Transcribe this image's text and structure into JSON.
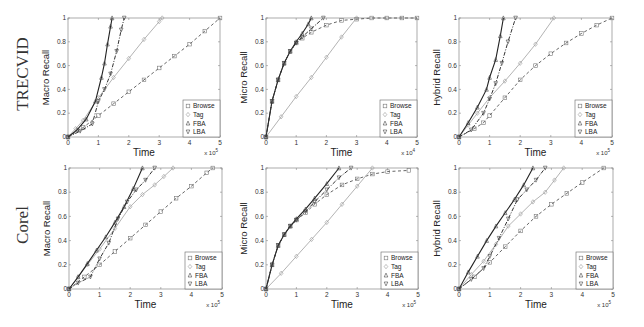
{
  "row_labels": [
    "TRECVID",
    "Corel"
  ],
  "legend": [
    "Browse",
    "Tag",
    "FBA",
    "LBA"
  ],
  "x_multiplier": "x 10^5",
  "chart_data": [
    {
      "type": "line",
      "dataset": "TRECVID",
      "title": "",
      "xlabel": "Time",
      "ylabel": "Macro Recall",
      "xlim": [
        0,
        5
      ],
      "ylim": [
        0,
        1
      ],
      "xticks": [
        0,
        1,
        2,
        3,
        4,
        5
      ],
      "yticks": [
        0,
        0.2,
        0.4,
        0.6,
        0.8,
        1
      ],
      "x_multiplier": "x 10^5",
      "legend_position": "lower right",
      "series": [
        {
          "name": "Browse",
          "x": [
            0,
            0.5,
            1,
            1.5,
            2,
            2.5,
            3,
            3.5,
            4,
            4.5,
            5
          ],
          "y": [
            0,
            0.08,
            0.18,
            0.28,
            0.38,
            0.48,
            0.58,
            0.68,
            0.78,
            0.89,
            1.0
          ]
        },
        {
          "name": "Tag",
          "x": [
            0,
            0.25,
            0.5,
            1,
            1.5,
            2,
            2.5,
            3,
            3.1
          ],
          "y": [
            0,
            0.07,
            0.14,
            0.33,
            0.5,
            0.66,
            0.82,
            0.97,
            1.0
          ]
        },
        {
          "name": "FBA",
          "x": [
            0,
            0.3,
            0.6,
            0.9,
            1.1,
            1.2,
            1.3,
            1.4,
            1.45
          ],
          "y": [
            0,
            0.06,
            0.15,
            0.3,
            0.5,
            0.62,
            0.78,
            0.93,
            1.0
          ]
        },
        {
          "name": "LBA",
          "x": [
            0,
            0.4,
            0.8,
            1.0,
            1.2,
            1.4,
            1.6,
            1.75,
            1.85
          ],
          "y": [
            0,
            0.05,
            0.11,
            0.3,
            0.4,
            0.53,
            0.72,
            0.9,
            1.0
          ]
        }
      ]
    },
    {
      "type": "line",
      "dataset": "TRECVID",
      "title": "",
      "xlabel": "Time",
      "ylabel": "Micro Recall",
      "xlim": [
        0,
        5
      ],
      "ylim": [
        0,
        1
      ],
      "xticks": [
        0,
        1,
        2,
        3,
        4,
        5
      ],
      "yticks": [
        0,
        0.2,
        0.4,
        0.6,
        0.8,
        1
      ],
      "x_multiplier": "x 10^4",
      "legend_position": "lower right",
      "series": [
        {
          "name": "Browse",
          "x": [
            0,
            0.2,
            0.4,
            0.6,
            0.8,
            1.0,
            1.2,
            1.5,
            2.0,
            2.5,
            3.0,
            3.5,
            4.0,
            4.5,
            5.0
          ],
          "y": [
            0,
            0.3,
            0.48,
            0.62,
            0.72,
            0.79,
            0.83,
            0.88,
            0.94,
            0.98,
            0.99,
            1.0,
            1.0,
            1.0,
            1.0
          ]
        },
        {
          "name": "Tag",
          "x": [
            0,
            0.5,
            1,
            1.5,
            2,
            2.5,
            3.0
          ],
          "y": [
            0,
            0.17,
            0.34,
            0.5,
            0.67,
            0.84,
            1.0
          ]
        },
        {
          "name": "FBA",
          "x": [
            0,
            0.2,
            0.4,
            0.6,
            0.8,
            1.0,
            1.2,
            1.4,
            1.5
          ],
          "y": [
            0,
            0.3,
            0.48,
            0.62,
            0.72,
            0.8,
            0.87,
            0.95,
            1.0
          ]
        },
        {
          "name": "LBA",
          "x": [
            0,
            0.2,
            0.4,
            0.6,
            0.8,
            1.0,
            1.2,
            1.5,
            1.9
          ],
          "y": [
            0,
            0.3,
            0.48,
            0.62,
            0.72,
            0.79,
            0.84,
            0.91,
            1.0
          ]
        }
      ]
    },
    {
      "type": "line",
      "dataset": "TRECVID",
      "title": "",
      "xlabel": "Time",
      "ylabel": "Hybrid Recall",
      "xlim": [
        0,
        5
      ],
      "ylim": [
        0,
        1
      ],
      "xticks": [
        0,
        1,
        2,
        3,
        4,
        5
      ],
      "yticks": [
        0,
        0.2,
        0.4,
        0.6,
        0.8,
        1
      ],
      "x_multiplier": "x 10^5",
      "legend_position": "lower right",
      "series": [
        {
          "name": "Browse",
          "x": [
            0,
            0.5,
            0.8,
            1.0,
            1.5,
            2.0,
            2.5,
            3.0,
            3.5,
            4.0,
            4.5,
            5.0
          ],
          "y": [
            0,
            0.07,
            0.12,
            0.18,
            0.33,
            0.48,
            0.6,
            0.7,
            0.79,
            0.87,
            0.94,
            1.0
          ]
        },
        {
          "name": "Tag",
          "x": [
            0,
            0.3,
            0.6,
            1.0,
            1.5,
            2.0,
            2.5,
            3.1
          ],
          "y": [
            0,
            0.1,
            0.2,
            0.33,
            0.47,
            0.62,
            0.78,
            1.0
          ]
        },
        {
          "name": "FBA",
          "x": [
            0,
            0.3,
            0.6,
            0.9,
            1.0,
            1.2,
            1.35,
            1.45
          ],
          "y": [
            0,
            0.12,
            0.25,
            0.4,
            0.5,
            0.65,
            0.85,
            1.0
          ]
        },
        {
          "name": "LBA",
          "x": [
            0,
            0.4,
            0.8,
            1.0,
            1.2,
            1.4,
            1.6,
            1.85
          ],
          "y": [
            0,
            0.06,
            0.2,
            0.32,
            0.45,
            0.62,
            0.8,
            1.0
          ]
        }
      ]
    },
    {
      "type": "line",
      "dataset": "Corel",
      "title": "",
      "xlabel": "Time",
      "ylabel": "Macro Recall",
      "xlim": [
        0,
        5
      ],
      "ylim": [
        0,
        1
      ],
      "xticks": [
        0,
        1,
        2,
        3,
        4,
        5
      ],
      "yticks": [
        0,
        0.2,
        0.4,
        0.6,
        0.8,
        1
      ],
      "x_multiplier": "x 10^5",
      "legend_position": "lower right",
      "series": [
        {
          "name": "Browse",
          "x": [
            0,
            0.5,
            1,
            1.5,
            2,
            2.5,
            3,
            3.5,
            4,
            4.5,
            4.7
          ],
          "y": [
            0,
            0.1,
            0.2,
            0.31,
            0.42,
            0.53,
            0.64,
            0.75,
            0.85,
            0.96,
            1.0
          ]
        },
        {
          "name": "Tag",
          "x": [
            0,
            0.3,
            0.6,
            1.0,
            1.5,
            2.0,
            2.4,
            2.8,
            3.1,
            3.4
          ],
          "y": [
            0,
            0.1,
            0.2,
            0.33,
            0.5,
            0.68,
            0.78,
            0.86,
            0.93,
            1.0
          ]
        },
        {
          "name": "FBA",
          "x": [
            0,
            0.3,
            0.6,
            0.9,
            1.2,
            1.5,
            1.8,
            2.1,
            2.4
          ],
          "y": [
            0,
            0.1,
            0.21,
            0.32,
            0.43,
            0.55,
            0.68,
            0.83,
            1.0
          ]
        },
        {
          "name": "LBA",
          "x": [
            0,
            0.3,
            0.7,
            1.0,
            1.3,
            1.6,
            1.9,
            2.2,
            2.5,
            2.8
          ],
          "y": [
            0,
            0.05,
            0.1,
            0.25,
            0.38,
            0.58,
            0.72,
            0.82,
            0.9,
            1.0
          ]
        }
      ]
    },
    {
      "type": "line",
      "dataset": "Corel",
      "title": "",
      "xlabel": "Time",
      "ylabel": "Micro Recall",
      "xlim": [
        0,
        5
      ],
      "ylim": [
        0,
        1
      ],
      "xticks": [
        0,
        1,
        2,
        3,
        4,
        5
      ],
      "yticks": [
        0,
        0.2,
        0.4,
        0.6,
        0.8,
        1
      ],
      "x_multiplier": "x 10^5",
      "legend_position": "lower right",
      "series": [
        {
          "name": "Browse",
          "x": [
            0,
            0.2,
            0.4,
            0.6,
            0.8,
            1.0,
            1.3,
            1.6,
            2.0,
            2.5,
            3.0,
            3.5,
            4.0,
            4.7
          ],
          "y": [
            0,
            0.2,
            0.36,
            0.45,
            0.52,
            0.57,
            0.63,
            0.7,
            0.78,
            0.86,
            0.91,
            0.95,
            0.97,
            0.98
          ]
        },
        {
          "name": "Tag",
          "x": [
            0,
            0.5,
            1,
            1.5,
            2,
            2.5,
            3.0,
            3.5
          ],
          "y": [
            0,
            0.13,
            0.27,
            0.41,
            0.55,
            0.7,
            0.85,
            1.0
          ]
        },
        {
          "name": "FBA",
          "x": [
            0,
            0.2,
            0.4,
            0.6,
            0.8,
            1.0,
            1.3,
            1.6,
            2.0,
            2.4
          ],
          "y": [
            0,
            0.2,
            0.36,
            0.45,
            0.52,
            0.58,
            0.66,
            0.75,
            0.87,
            1.0
          ]
        },
        {
          "name": "LBA",
          "x": [
            0,
            0.2,
            0.4,
            0.6,
            0.8,
            1.0,
            1.3,
            1.6,
            2.0,
            2.4,
            2.8
          ],
          "y": [
            0,
            0.2,
            0.36,
            0.45,
            0.52,
            0.57,
            0.64,
            0.72,
            0.82,
            0.92,
            1.0
          ]
        }
      ]
    },
    {
      "type": "line",
      "dataset": "Corel",
      "title": "",
      "xlabel": "Time",
      "ylabel": "Hybrid Recall",
      "xlim": [
        0,
        5
      ],
      "ylim": [
        0,
        1
      ],
      "xticks": [
        0,
        1,
        2,
        3,
        4,
        5
      ],
      "yticks": [
        0,
        0.2,
        0.4,
        0.6,
        0.8,
        1
      ],
      "x_multiplier": "x 10^5",
      "legend_position": "lower right",
      "series": [
        {
          "name": "Browse",
          "x": [
            0,
            0.5,
            1.0,
            1.5,
            2.0,
            2.5,
            3.0,
            3.5,
            4.0,
            4.7
          ],
          "y": [
            0,
            0.1,
            0.22,
            0.35,
            0.48,
            0.6,
            0.7,
            0.79,
            0.88,
            1.0
          ]
        },
        {
          "name": "Tag",
          "x": [
            0,
            0.4,
            0.8,
            1.2,
            1.6,
            2.0,
            2.4,
            2.8,
            3.1,
            3.4
          ],
          "y": [
            0,
            0.12,
            0.23,
            0.37,
            0.52,
            0.62,
            0.72,
            0.8,
            0.9,
            1.0
          ]
        },
        {
          "name": "FBA",
          "x": [
            0,
            0.3,
            0.6,
            0.9,
            1.2,
            1.5,
            1.8,
            2.1,
            2.4
          ],
          "y": [
            0,
            0.14,
            0.27,
            0.4,
            0.52,
            0.63,
            0.74,
            0.86,
            1.0
          ]
        },
        {
          "name": "LBA",
          "x": [
            0,
            0.4,
            0.8,
            1.0,
            1.3,
            1.6,
            1.9,
            2.2,
            2.5,
            2.8
          ],
          "y": [
            0,
            0.08,
            0.17,
            0.27,
            0.42,
            0.58,
            0.74,
            0.82,
            0.9,
            1.0
          ]
        }
      ]
    }
  ]
}
